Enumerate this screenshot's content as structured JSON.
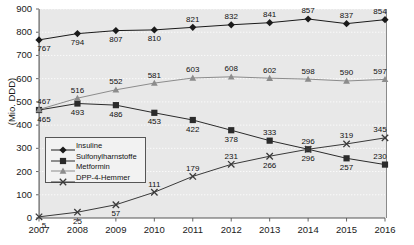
{
  "chart_data": {
    "type": "line",
    "title": "",
    "xlabel": "",
    "ylabel": "(Mio. DDD)",
    "categories": [
      "2007",
      "2008",
      "2009",
      "2010",
      "2011",
      "2012",
      "2013",
      "2014",
      "2015",
      "2016"
    ],
    "x": [
      2007,
      2008,
      2009,
      2010,
      2011,
      2012,
      2013,
      2014,
      2015,
      2016
    ],
    "ylim": [
      0,
      900
    ],
    "yticks": [
      0,
      100,
      200,
      300,
      400,
      500,
      600,
      700,
      800,
      900
    ],
    "grid": true,
    "legend_position": "inside-left",
    "series": [
      {
        "name": "Insuline",
        "marker": "diamond",
        "color": "#1a1a1a",
        "values": [
          767,
          794,
          807,
          810,
          821,
          832,
          841,
          857,
          837,
          854
        ]
      },
      {
        "name": "Sulfonylharnstoffe",
        "marker": "square",
        "color": "#2b2b2b",
        "values": [
          465,
          493,
          486,
          453,
          422,
          378,
          333,
          296,
          257,
          230
        ]
      },
      {
        "name": "Metformin",
        "marker": "triangle",
        "color": "#8c8c8c",
        "values": [
          467,
          516,
          552,
          581,
          603,
          608,
          602,
          598,
          590,
          597
        ]
      },
      {
        "name": "DPP-4-Hemmer",
        "marker": "cross",
        "color": "#3a3a3a",
        "values": [
          5,
          25,
          57,
          111,
          179,
          231,
          266,
          296,
          319,
          345
        ]
      }
    ]
  },
  "legend": {
    "items": [
      {
        "label": "Insuline"
      },
      {
        "label": "Sulfonylharnstoffe"
      },
      {
        "label": "Metformin"
      },
      {
        "label": "DPP-4-Hemmer"
      }
    ]
  },
  "axes": {
    "y_axis_title": "(Mio. DDD)",
    "y_tick_labels": [
      "900",
      "800",
      "700",
      "600",
      "500",
      "400",
      "300",
      "200",
      "100",
      "0"
    ],
    "x_tick_labels": [
      "2007",
      "2008",
      "2009",
      "2010",
      "2011",
      "2012",
      "2013",
      "2014",
      "2015",
      "2016"
    ]
  }
}
